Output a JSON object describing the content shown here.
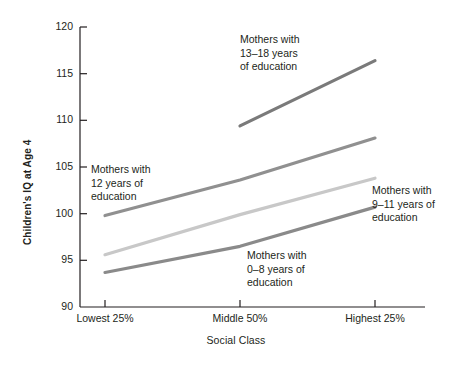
{
  "chart_data": {
    "type": "line",
    "title": "",
    "xlabel": "Social Class",
    "ylabel": "Children's IQ at Age 4",
    "categories": [
      "Lowest 25%",
      "Middle 50%",
      "Highest 25%"
    ],
    "xtick_labels": [
      "Lowest 25%",
      "Middle 50%",
      "Highest 25%"
    ],
    "ytick_labels": [
      "90",
      "95",
      "100",
      "105",
      "110",
      "115",
      "120"
    ],
    "yticks": [
      90,
      95,
      100,
      105,
      110,
      115,
      120
    ],
    "ylim": [
      90,
      120
    ],
    "grid": false,
    "legend_position": "inline-annotations",
    "series": [
      {
        "name": "Mothers with 13–18 years of education",
        "values": [
          null,
          109.4,
          116.4
        ],
        "color": "#7a7a7a"
      },
      {
        "name": "Mothers with 12 years of education",
        "values": [
          99.8,
          103.6,
          108.1
        ],
        "color": "#909090"
      },
      {
        "name": "Mothers with 9–11 years of education",
        "values": [
          95.6,
          99.9,
          103.8
        ],
        "color": "#c8c8c8"
      },
      {
        "name": "Mothers with 0–8 years of education",
        "values": [
          93.7,
          96.5,
          100.7
        ],
        "color": "#8a8a8a"
      }
    ],
    "annotations": [
      {
        "id": "ann-13-18",
        "text": "Mothers with\n13–18 years\nof education"
      },
      {
        "id": "ann-12",
        "text": "Mothers with\n12 years of\neducation"
      },
      {
        "id": "ann-9-11",
        "text": "Mothers with\n9–11 years of\neducation"
      },
      {
        "id": "ann-0-8",
        "text": "Mothers with\n0–8 years of\neducation"
      }
    ],
    "colors": {
      "axis": "#231f20",
      "background": "#ffffff",
      "text": "#231f20"
    }
  },
  "ticks": {
    "y": {
      "t120": "120",
      "t115": "115",
      "t110": "110",
      "t105": "105",
      "t100": "100",
      "t95": "95",
      "t90": "90"
    },
    "x": {
      "x1": "Lowest 25%",
      "x2": "Middle 50%",
      "x3": "Highest 25%"
    }
  },
  "labels": {
    "y_axis": "Children's IQ at Age 4",
    "x_axis": "Social Class"
  },
  "annotations": {
    "a13_18": "Mothers with\n13–18 years\nof education",
    "a12": "Mothers with\n12 years of\neducation",
    "a9_11": "Mothers with\n9–11 years of\neducation",
    "a0_8": "Mothers with\n0–8 years of\neducation"
  }
}
